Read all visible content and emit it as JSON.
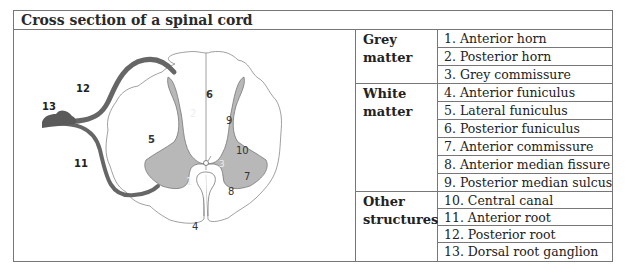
{
  "title": "Cross section of a spinal cord",
  "diagram": {
    "labels": {
      "l1": "1",
      "l2": "2",
      "l3": "3",
      "l4": "4",
      "l5": "5",
      "l6": "6",
      "l7": "7",
      "l8": "8",
      "l9": "9",
      "l10": "10",
      "l11": "11",
      "l12": "12",
      "l13": "13"
    },
    "colors": {
      "grey_matter": "#b8b8b8",
      "roots": "#666666",
      "outline": "#888888"
    }
  },
  "legend": [
    {
      "category_line1": "Grey",
      "category_line2": "matter",
      "items": [
        "1. Anterior horn",
        "2. Posterior horn",
        "3. Grey commissure"
      ]
    },
    {
      "category_line1": "White",
      "category_line2": "matter",
      "items": [
        "4. Anterior funiculus",
        "5. Lateral funiculus",
        "6. Posterior funiculus",
        "7. Anterior commissure",
        "8. Anterior median fissure",
        "9. Posterior median sulcus"
      ]
    },
    {
      "category_line1": "Other",
      "category_line2": "structures",
      "items": [
        "10. Central canal",
        "11. Anterior root",
        "12. Posterior root",
        "13. Dorsal root ganglion"
      ]
    }
  ]
}
